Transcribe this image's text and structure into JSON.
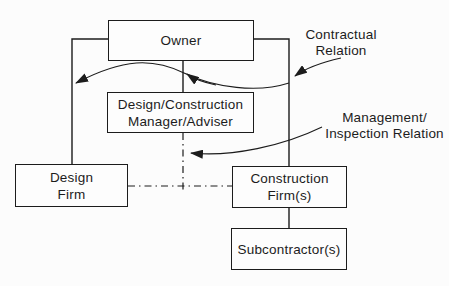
{
  "colors": {
    "background": "#fcfcfc",
    "ink": "#1c1c1c",
    "box_fill": "#fdfdfd"
  },
  "boxes": {
    "owner": {
      "line1": "Owner"
    },
    "manager": {
      "line1": "Design/Construction",
      "line2": "Manager/Adviser"
    },
    "design_firm": {
      "line1": "Design",
      "line2": "Firm"
    },
    "construction_firm": {
      "line1": "Construction",
      "line2": "Firm(s)"
    },
    "subcontractor": {
      "line1": "Subcontractor(s)"
    }
  },
  "annotations": {
    "contractual": {
      "line1": "Contractual",
      "line2": "Relation"
    },
    "management": {
      "line1": "Management/",
      "line2": "Inspection Relation"
    }
  }
}
